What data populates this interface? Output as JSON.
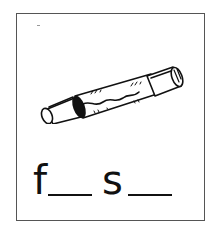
{
  "card": {
    "image": {
      "icon": "fuse-icon",
      "description": "glass cartridge fuse with wavy filament"
    },
    "word_prompt": {
      "letters": [
        "f",
        "s"
      ],
      "blanks": 2,
      "display": "f__ s__"
    }
  },
  "colors": {
    "border": "#555555",
    "ink": "#111111",
    "background": "#ffffff"
  }
}
